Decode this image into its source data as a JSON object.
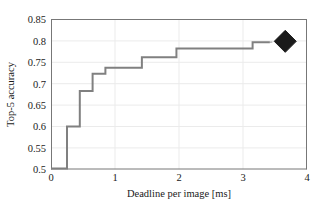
{
  "chart_data": {
    "type": "line",
    "title": "",
    "xlabel": "Deadline per image [ms]",
    "ylabel": "Top-5 accuracy",
    "xlim": [
      0,
      4
    ],
    "ylim": [
      0.5,
      0.85
    ],
    "xticks": [
      0,
      1,
      2,
      3,
      4
    ],
    "xtick_labels": [
      "0",
      "1",
      "2",
      "3",
      "4"
    ],
    "yticks": [
      0.5,
      0.55,
      0.6,
      0.65,
      0.7,
      0.75,
      0.8,
      0.85
    ],
    "ytick_labels": [
      "0.5",
      "0.55",
      "0.6",
      "0.65",
      "0.7",
      "0.75",
      "0.8",
      "0.85"
    ],
    "grid": true,
    "legend": null,
    "series": [
      {
        "name": "step-curve",
        "drawstyle": "steps-post",
        "color": "#808080",
        "linewidth": 2,
        "x": [
          0.0,
          0.25,
          0.45,
          0.65,
          0.85,
          1.42,
          1.96,
          3.15,
          3.42
        ],
        "y": [
          0.502,
          0.6,
          0.683,
          0.723,
          0.737,
          0.762,
          0.782,
          0.797,
          0.797
        ]
      },
      {
        "name": "connector-dashed",
        "drawstyle": "dashed",
        "color": "#b0b0b0",
        "linewidth": 1,
        "x": [
          3.42,
          3.66
        ],
        "y": [
          0.797,
          0.799
        ]
      }
    ],
    "markers": [
      {
        "name": "baseline-point",
        "shape": "diamond",
        "x": 3.66,
        "y": 0.799,
        "color": "#1a1a1a",
        "size": 11
      }
    ]
  },
  "axes": {
    "x_label": "Deadline per image [ms]",
    "y_label": "Top-5 accuracy"
  },
  "colors": {
    "line": "#808080",
    "marker": "#1a1a1a",
    "grid": "#e8e8e8",
    "axis": "#6e6e6e",
    "text": "#1a1a1a",
    "background": "#ffffff"
  }
}
